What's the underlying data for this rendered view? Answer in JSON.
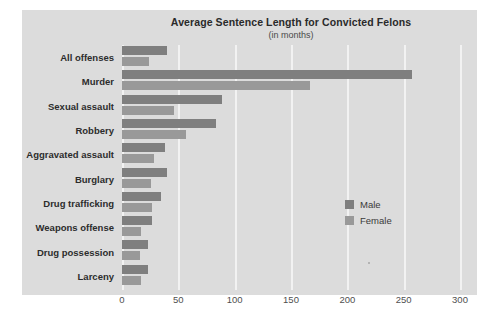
{
  "chart_data": {
    "type": "bar",
    "orientation": "horizontal",
    "title": "Average Sentence Length for Convicted Felons",
    "subtitle": "(in months)",
    "xlabel": "",
    "ylabel": "",
    "xlim": [
      0,
      300
    ],
    "xticks": [
      0,
      50,
      100,
      150,
      200,
      250,
      300
    ],
    "xtick_labels": [
      "0",
      "50",
      "100",
      "150",
      "200",
      "250",
      "300"
    ],
    "grid": "vertical-white-gridlines",
    "legend_position": "middle-right-inside",
    "categories": [
      "All offenses",
      "Murder",
      "Sexual assault",
      "Robbery",
      "Aggravated assault",
      "Burglary",
      "Drug trafficking",
      "Weapons offense",
      "Drug possession",
      "Larceny"
    ],
    "series": [
      {
        "name": "Male",
        "color": "#7f7f7f",
        "values": [
          40,
          257,
          89,
          83,
          38,
          40,
          35,
          27,
          23,
          23
        ]
      },
      {
        "name": "Female",
        "color": "#999999",
        "values": [
          24,
          167,
          46,
          57,
          28,
          26,
          27,
          17,
          16,
          17
        ]
      }
    ]
  },
  "colors": {
    "figure_background": "#ffffff",
    "panel_background": "#dcdcdc",
    "gridline": "#f2f2f2",
    "axis_line": "#ffffff",
    "title_text": "#2a2a2a",
    "label_text": "#2c2c2c",
    "tick_text": "#4f4f4f"
  }
}
